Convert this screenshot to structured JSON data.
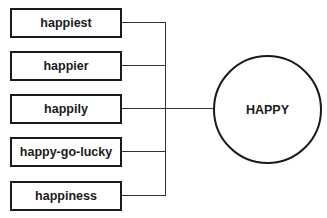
{
  "diagram": {
    "center": {
      "label": "HAPPY"
    },
    "words": [
      {
        "label": "happiest"
      },
      {
        "label": "happier"
      },
      {
        "label": "happily"
      },
      {
        "label": "happy-go-lucky"
      },
      {
        "label": "happiness"
      }
    ],
    "colors": {
      "stroke": "#1a1a1a",
      "background": "#ffffff"
    }
  }
}
